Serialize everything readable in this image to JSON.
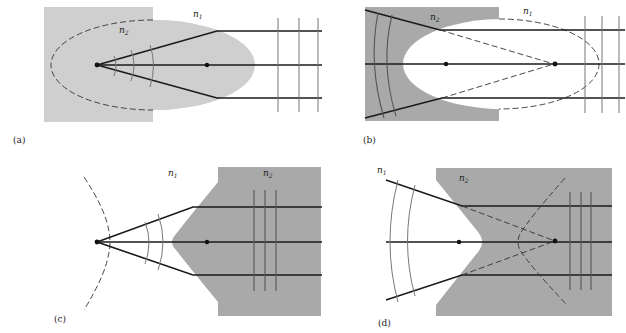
{
  "figure": {
    "colors": {
      "light_medium": "#cfcfcf",
      "dark_medium": "#a9a9a9",
      "ray": "#1a1a1a",
      "wavefront": "#777777"
    },
    "panels": [
      {
        "id": "a",
        "label": "(a)",
        "n1_label": "n",
        "n1_sub": "1",
        "n2_label": "n",
        "n2_sub": "2"
      },
      {
        "id": "b",
        "label": "(b)",
        "n1_label": "n",
        "n1_sub": "1",
        "n2_label": "n",
        "n2_sub": "2"
      },
      {
        "id": "c",
        "label": "(c)",
        "n1_label": "n",
        "n1_sub": "1",
        "n2_label": "n",
        "n2_sub": "2"
      },
      {
        "id": "d",
        "label": "(d)",
        "n1_label": "n",
        "n1_sub": "1",
        "n2_label": "n",
        "n2_sub": "2"
      }
    ]
  }
}
